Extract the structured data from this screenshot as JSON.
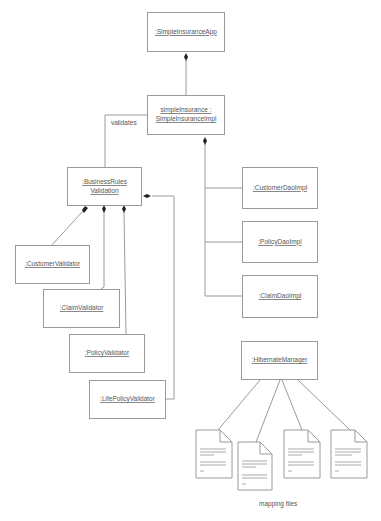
{
  "diagram": {
    "type": "UML object/composition diagram",
    "nodes": {
      "app": ":SimpleInsuranceApp",
      "impl_line1": "simpleInsurance :",
      "impl_line2": "SimpleInsuranceImpl",
      "brv_line1": ":BusinessRules",
      "brv_line2": "Validation",
      "customer_validator": ":CustomerValidator",
      "claim_validator": ":ClaimValidator",
      "policy_validator": ":PolicyValidator",
      "life_policy_validator": ":LifePolicyValidator",
      "customer_dao": ":CustomerDaoImpl",
      "policy_dao": ":PolicyDaoImpl",
      "claim_dao": ":ClaimDaoImpl",
      "hibernate_manager": ":HibernateManager"
    },
    "labels": {
      "validates": "validates",
      "mapping_files": "mapping files"
    },
    "edges": [
      {
        "from": "simpleInsurance",
        "to": "SimpleInsuranceApp",
        "kind": "composition"
      },
      {
        "from": "BusinessRulesValidation",
        "to": "simpleInsurance",
        "kind": "association",
        "label": "validates"
      },
      {
        "from": "CustomerDaoImpl",
        "to": "simpleInsurance",
        "kind": "composition"
      },
      {
        "from": "PolicyDaoImpl",
        "to": "simpleInsurance",
        "kind": "composition"
      },
      {
        "from": "ClaimDaoImpl",
        "to": "simpleInsurance",
        "kind": "composition"
      },
      {
        "from": "CustomerValidator",
        "to": "BusinessRulesValidation",
        "kind": "composition"
      },
      {
        "from": "ClaimValidator",
        "to": "BusinessRulesValidation",
        "kind": "composition"
      },
      {
        "from": "PolicyValidator",
        "to": "BusinessRulesValidation",
        "kind": "composition"
      },
      {
        "from": "LifePolicyValidator",
        "to": "BusinessRulesValidation",
        "kind": "composition"
      },
      {
        "from": "HibernateManager",
        "to": "mapping files",
        "kind": "association",
        "count": 4
      }
    ]
  }
}
